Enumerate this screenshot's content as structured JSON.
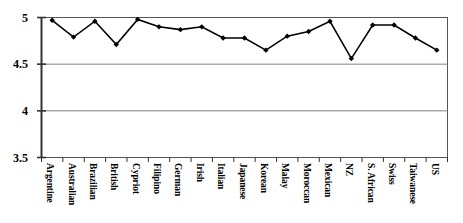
{
  "chart_data": {
    "type": "line",
    "title": "",
    "subtitle": "",
    "xlabel": "",
    "ylabel": "",
    "categories": [
      "Argentine",
      "Australian",
      "Brazilian",
      "British",
      "Cypriot",
      "Filipino",
      "German",
      "Irish",
      "Italian",
      "Japanese",
      "Korean",
      "Malay",
      "Moroccan",
      "Mexican",
      "NZ",
      "S. African",
      "Swiss",
      "Taiwanese",
      "US"
    ],
    "values": [
      4.97,
      4.79,
      4.96,
      4.71,
      4.98,
      4.9,
      4.87,
      4.9,
      4.78,
      4.78,
      4.65,
      4.8,
      4.85,
      4.96,
      4.56,
      4.92,
      4.92,
      4.78,
      4.65
    ],
    "ylim": [
      3.5,
      5.0
    ],
    "yticks": [
      3.5,
      4,
      4.5,
      5
    ],
    "ytick_labels": [
      "3.5",
      "4",
      "4.5",
      "5"
    ],
    "grid": "horizontal",
    "legend": "none",
    "series": [
      {
        "name": "",
        "values": [
          4.97,
          4.79,
          4.96,
          4.71,
          4.98,
          4.9,
          4.87,
          4.9,
          4.78,
          4.78,
          4.65,
          4.8,
          4.85,
          4.96,
          4.56,
          4.92,
          4.92,
          4.78,
          4.65
        ],
        "marker": "diamond",
        "color": "#000000"
      }
    ]
  },
  "style": {
    "line_color": "#000000",
    "marker_color": "#000000",
    "grid_color": "#808080",
    "axis_color": "#404040",
    "background": "#ffffff"
  }
}
